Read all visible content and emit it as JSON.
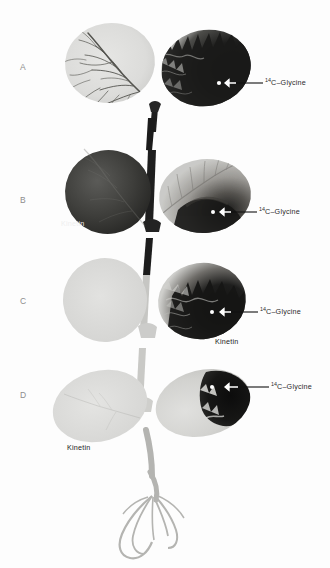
{
  "figure": {
    "type": "autoradiograph-plate",
    "background_color": "#fdfdfd",
    "width": 330,
    "height": 568,
    "panel_count": 4
  },
  "panels": [
    {
      "letter": "A",
      "letter_x": 24,
      "letter_y": 68,
      "tracer_label": "C–Glycine",
      "tracer_superscript": "14",
      "tracer_label_x": 266,
      "tracer_label_y": 83,
      "kinetin_label": null,
      "description": "Untreated pair: left leaf pale with dark vein tracery, right leaf heavily labeled dark."
    },
    {
      "letter": "B",
      "letter_x": 24,
      "letter_y": 201,
      "tracer_label": "C–Glycine",
      "tracer_superscript": "14",
      "tracer_label_x": 260,
      "tracer_label_y": 211,
      "kinetin_label": "Kinetin",
      "kinetin_label_x": 62,
      "kinetin_label_y": 226,
      "kinetin_on_dark": true,
      "description": "Kinetin on opposite (left) leaf: left leaf uniformly dark, tracer leaf retains less label."
    },
    {
      "letter": "C",
      "letter_x": 24,
      "letter_y": 302,
      "tracer_label": "C–Glycine",
      "tracer_superscript": "14",
      "tracer_label_x": 261,
      "tracer_label_y": 310,
      "kinetin_label": "Kinetin",
      "kinetin_label_x": 216,
      "kinetin_label_y": 343,
      "kinetin_on_dark": false,
      "description": "Kinetin on same leaf as tracer: tracer leaf strongly dark, opposite leaf pale."
    },
    {
      "letter": "D",
      "letter_x": 24,
      "letter_y": 396,
      "tracer_label": "C–Glycine",
      "tracer_superscript": "14",
      "tracer_label_x": 272,
      "tracer_label_y": 387,
      "kinetin_label": "Kinetin",
      "kinetin_label_x": 68,
      "kinetin_label_y": 449,
      "kinetin_on_dark": false,
      "description": "Rooted plant: label confined to leaf tip, both leaves pale, roots visible below."
    }
  ],
  "colors": {
    "paper": "#fdfdfd",
    "leaf_pale": "#dcdcda",
    "leaf_light": "#cfcfcd",
    "leaf_mid": "#9a9a98",
    "leaf_dark": "#3a3a38",
    "leaf_darkest": "#141414",
    "petiole_dark": "#1e1e1e",
    "petiole_pale": "#cfcfcd",
    "vein_dark": "#4a4a48",
    "label_text": "#2b2b2b",
    "panel_letter": "#8d8d8d",
    "arrow_white": "#ffffff",
    "arrow_black": "#111111",
    "application_dot": "#ffffff"
  }
}
